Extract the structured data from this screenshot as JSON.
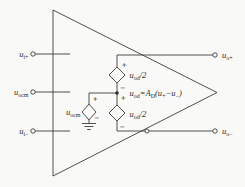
{
  "figure": {
    "background": "#f9f9f7",
    "line_color": "#3c3c3c",
    "text_color": "#2e2e2e",
    "kind": "fully-differential-opamp-schematic"
  },
  "inputs": [
    {
      "base": "u",
      "sub": "i+"
    },
    {
      "base": "u",
      "sub": "ocm"
    },
    {
      "base": "u",
      "sub": "i−"
    }
  ],
  "outputs": [
    {
      "base": "u",
      "sub": "o+"
    },
    {
      "base": "u",
      "sub": "o−"
    }
  ],
  "sources": {
    "ocm_label": {
      "base": "u",
      "sub": "ocm"
    },
    "od_half_top": {
      "base": "u",
      "sub": "od",
      "suffix": "/2"
    },
    "od_half_bottom": {
      "base": "u",
      "sub": "od",
      "suffix": "/2"
    },
    "plus": "+",
    "minus": "−"
  },
  "equation": {
    "u": "u",
    "u_sub": "od",
    "eq_a": "=A",
    "a_sub": "D",
    "open": "(u",
    "plus_sub": "+",
    "minus_u": "−u",
    "minus_sub": "−",
    "close": ")"
  }
}
